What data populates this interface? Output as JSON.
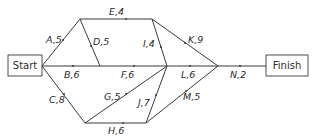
{
  "diagram": {
    "type": "activity-network",
    "start_label": "Start",
    "finish_label": "Finish",
    "colors": {
      "line": "#3a3a3a",
      "text": "#2a2a2a",
      "background": "#ffffff"
    },
    "activities": [
      {
        "id": "A",
        "duration": 5,
        "label": "A,5"
      },
      {
        "id": "B",
        "duration": 6,
        "label": "B,6"
      },
      {
        "id": "C",
        "duration": 8,
        "label": "C,8"
      },
      {
        "id": "D",
        "duration": 5,
        "label": "D,5"
      },
      {
        "id": "E",
        "duration": 4,
        "label": "E,4"
      },
      {
        "id": "F",
        "duration": 6,
        "label": "F,6"
      },
      {
        "id": "G",
        "duration": 5,
        "label": "G,5"
      },
      {
        "id": "H",
        "duration": 6,
        "label": "H,6"
      },
      {
        "id": "I",
        "duration": 4,
        "label": "I,4"
      },
      {
        "id": "J",
        "duration": 7,
        "label": "J,7"
      },
      {
        "id": "K",
        "duration": 9,
        "label": "K,9"
      },
      {
        "id": "L",
        "duration": 6,
        "label": "L,6"
      },
      {
        "id": "M",
        "duration": 5,
        "label": "M,5"
      },
      {
        "id": "N",
        "duration": 2,
        "label": "N,2"
      }
    ]
  }
}
